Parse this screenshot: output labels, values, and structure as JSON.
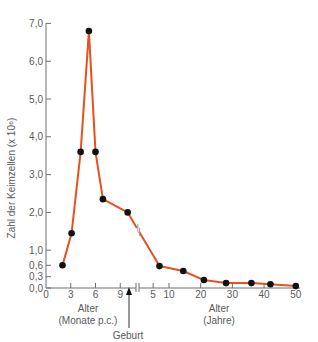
{
  "chart_data": {
    "type": "line",
    "title": "",
    "ylabel": "Zahl der Keimzellen (x 10⁶)",
    "ylim": [
      0,
      7.0
    ],
    "yticks": [
      {
        "value": 0.0,
        "label": "0,0"
      },
      {
        "value": 0.3,
        "label": "0,3"
      },
      {
        "value": 0.6,
        "label": "0,6"
      },
      {
        "value": 1.0,
        "label": "1,0"
      },
      {
        "value": 2.0,
        "label": "2,0"
      },
      {
        "value": 3.0,
        "label": "3,0"
      },
      {
        "value": 4.0,
        "label": "4,0"
      },
      {
        "value": 5.0,
        "label": "5,0"
      },
      {
        "value": 6.0,
        "label": "6,0"
      },
      {
        "value": 7.0,
        "label": "7,0"
      }
    ],
    "x_segments": [
      {
        "name": "prenatal",
        "xlabel_line1": "Alter",
        "xlabel_line2": "(Monate p.c.)",
        "unit": "months",
        "xticks": [
          {
            "value": 0,
            "label": "0"
          },
          {
            "value": 3,
            "label": "3"
          },
          {
            "value": 6,
            "label": "6"
          },
          {
            "value": 9,
            "label": "9"
          }
        ]
      },
      {
        "name": "postnatal",
        "xlabel_line1": "Alter",
        "xlabel_line2": "(Jahre)",
        "unit": "years",
        "xticks": [
          {
            "value": 5,
            "label": "5"
          },
          {
            "value": 10,
            "label": "10"
          },
          {
            "value": 20,
            "label": "20"
          },
          {
            "value": 30,
            "label": "30"
          },
          {
            "value": 40,
            "label": "40"
          },
          {
            "value": 50,
            "label": "50"
          }
        ]
      }
    ],
    "annotation": {
      "label": "Geburt",
      "arrow_at": "birth (~9.5 months)"
    },
    "series": [
      {
        "name": "Keimzellen",
        "color": "#e8501e",
        "marker_color": "#111111",
        "points": [
          {
            "segment": "prenatal",
            "x": 2,
            "y": 0.6
          },
          {
            "segment": "prenatal",
            "x": 3.1,
            "y": 1.45
          },
          {
            "segment": "prenatal",
            "x": 4.2,
            "y": 3.6
          },
          {
            "segment": "prenatal",
            "x": 5.2,
            "y": 6.8
          },
          {
            "segment": "prenatal",
            "x": 6.0,
            "y": 3.6
          },
          {
            "segment": "prenatal",
            "x": 6.9,
            "y": 2.35
          },
          {
            "segment": "prenatal",
            "x": 9.9,
            "y": 2.0
          },
          {
            "segment": "postnatal",
            "x": 7,
            "y": 0.58
          },
          {
            "segment": "postnatal",
            "x": 14.5,
            "y": 0.45
          },
          {
            "segment": "postnatal",
            "x": 21,
            "y": 0.21
          },
          {
            "segment": "postnatal",
            "x": 28,
            "y": 0.13
          },
          {
            "segment": "postnatal",
            "x": 36,
            "y": 0.13
          },
          {
            "segment": "postnatal",
            "x": 42,
            "y": 0.1
          },
          {
            "segment": "postnatal",
            "x": 50,
            "y": 0.05
          }
        ]
      }
    ],
    "grid": false,
    "legend": null
  },
  "colors": {
    "axis": "#6e6e6e",
    "text": "#5a5a5a",
    "line": "#e8501e",
    "marker": "#111111",
    "break_mark": "#9a9a9a"
  }
}
